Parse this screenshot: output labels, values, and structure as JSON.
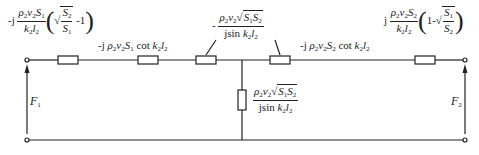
{
  "diagram": {
    "type": "equivalent circuit (T-network / acoustic transmission)",
    "colors": {
      "line": "#222222",
      "background": "#ffffff"
    },
    "series_impedances": [
      {
        "id": "z1",
        "label": "-j (ρ2 v2 S1 / k2 l2) (√(S2/S1) - 1)"
      },
      {
        "id": "z2",
        "label": "-j ρ2 v2 S1 cot k2 l2"
      },
      {
        "id": "z3",
        "label": "-(ρ2 v2 √(S1 S2)) / (j sin k2 l2)"
      },
      {
        "id": "z4",
        "label": "-j ρ2 v2 S2 cot k2 l2"
      },
      {
        "id": "z5",
        "label": "j (ρ2 v2 S2 / k2 l2) (1 - √(S1/S2))"
      }
    ],
    "shunt_impedance": {
      "id": "zs",
      "label": "(ρ2 v2 √(S1 S2)) / (j sin k2 l2)"
    },
    "ports": [
      {
        "id": "port1",
        "label": "F1"
      },
      {
        "id": "port2",
        "label": "F2"
      }
    ],
    "text": {
      "j": "j",
      "minus_j": "-j",
      "minus": "-",
      "one": "1",
      "minus_one": "-1",
      "one_minus": "1-",
      "rho2": "ρ",
      "v2": "v",
      "S": "S",
      "k": "k",
      "l": "l",
      "cot": "cot",
      "jsin": "jsin",
      "F": "F",
      "sub1": "1",
      "sub2": "2"
    }
  }
}
